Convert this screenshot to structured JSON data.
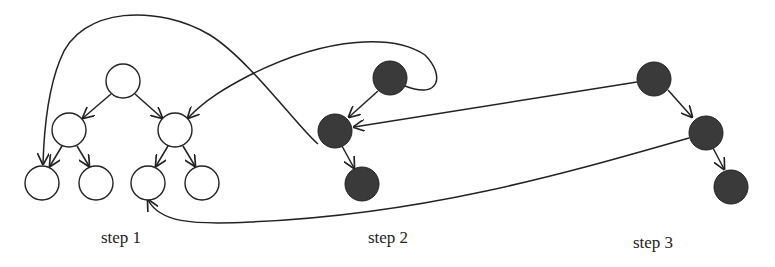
{
  "diagram": {
    "colors": {
      "stroke": "#222222",
      "filled": "#3a3a3a",
      "empty": "#ffffff",
      "background": "#ffffff"
    },
    "steps": [
      {
        "label": "step 1",
        "nodes": 7,
        "style": "hollow binary tree"
      },
      {
        "label": "step 2",
        "nodes": 3,
        "style": "filled"
      },
      {
        "label": "step 3",
        "nodes": 3,
        "style": "filled"
      }
    ],
    "labels": {
      "step1": "step 1",
      "step2": "step 2",
      "step3": "step 3"
    }
  }
}
